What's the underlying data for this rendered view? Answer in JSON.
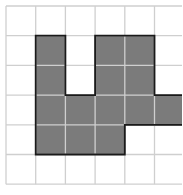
{
  "diagram": {
    "type": "grid-shape",
    "grid": {
      "origin_x": 6,
      "origin_y": 6,
      "cell_size": 29.7,
      "columns": 7,
      "rows": 6,
      "line_color": "#cfcfcf",
      "inner_line_color": "#a0a0a0",
      "background": "#ffffff"
    },
    "shape": {
      "fill_color": "#7b7b7b",
      "outline_color": "#1a1a1a",
      "shaded_cells": [
        [
          1,
          1
        ],
        [
          1,
          2
        ],
        [
          1,
          3
        ],
        [
          1,
          4
        ],
        [
          2,
          3
        ],
        [
          2,
          4
        ],
        [
          3,
          1
        ],
        [
          3,
          2
        ],
        [
          3,
          3
        ],
        [
          3,
          4
        ],
        [
          4,
          1
        ],
        [
          4,
          2
        ],
        [
          4,
          3
        ],
        [
          5,
          3
        ],
        [
          6,
          3
        ]
      ]
    }
  }
}
